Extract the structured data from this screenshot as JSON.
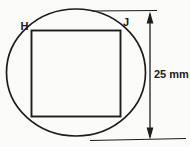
{
  "diagram": {
    "vertex_labels": {
      "top_left": "H",
      "top_right": "J"
    },
    "dimension_label": "25 mm",
    "colors": {
      "line": "#1c1c1c",
      "square_fill": "#b0b0ad",
      "background": "#fbfbf9"
    }
  }
}
